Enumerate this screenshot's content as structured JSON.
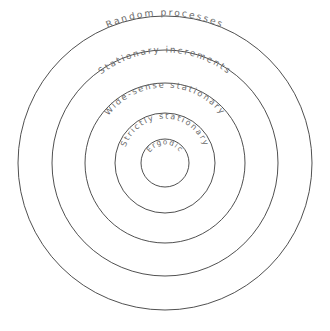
{
  "diagram": {
    "type": "nested-circles",
    "title": "",
    "background_color": "#ffffff",
    "stroke_color": "#3c3c3c",
    "text_color": "#6b6b6b",
    "center": {
      "x": 165,
      "y": 163
    },
    "rings": [
      {
        "id": "random-processes",
        "label": "Random processes",
        "radius": 147,
        "level": 1,
        "label_font_size": 9.2,
        "label_letter_spacing": 2.0
      },
      {
        "id": "stationary-increments",
        "label": "Stationary increments",
        "radius": 113,
        "level": 2,
        "label_font_size": 8.8,
        "label_letter_spacing": 1.9
      },
      {
        "id": "wide-sense-stationary",
        "label": "Wide-sense stationary",
        "radius": 80,
        "level": 3,
        "label_font_size": 8.4,
        "label_letter_spacing": 1.8
      },
      {
        "id": "strictly-stationary",
        "label": "Strictly stationary",
        "radius": 50,
        "level": 4,
        "label_font_size": 8.0,
        "label_letter_spacing": 1.7
      },
      {
        "id": "ergodic",
        "label": "Ergodic",
        "radius": 24,
        "level": 5,
        "label_font_size": 7.2,
        "label_letter_spacing": 1.3
      }
    ]
  }
}
